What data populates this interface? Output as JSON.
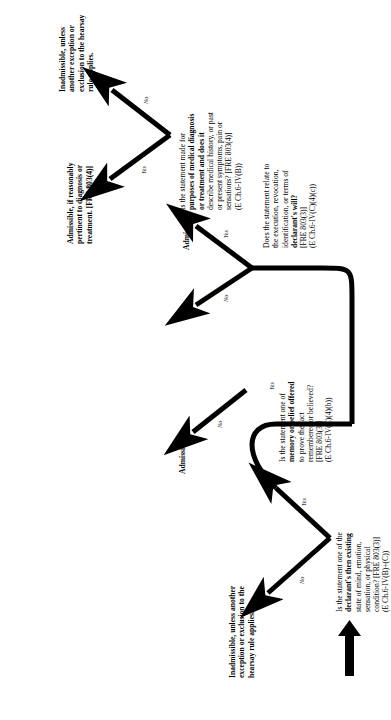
{
  "diagram": {
    "orientation": "rotated-90-ccw",
    "colors": {
      "ink": "#000000",
      "paper": "#ffffff"
    },
    "start": {
      "label": "",
      "icon": "up-arrow-start-marker"
    },
    "nodes": [
      {
        "id": "q-state-of-mind",
        "kind": "question",
        "lines": [
          {
            "t": "Is the statement one of the",
            "bold": false
          },
          {
            "t": "declarant's then existing",
            "bold": true
          },
          {
            "t": "state of mind, emotion,",
            "bold": false
          },
          {
            "t": "sensation, or physical",
            "bold": false
          },
          {
            "t": "condition? [FRE 803(3)]",
            "bold": false
          },
          {
            "t": "(E Ch.6-IV(B)+(C))",
            "bold": false
          }
        ]
      },
      {
        "id": "q-memory-belief",
        "kind": "question",
        "lines": [
          {
            "t": "Is the statement one of",
            "bold": false
          },
          {
            "t": "memory or belief offered",
            "bold": true
          },
          {
            "t": "to prove the fact",
            "bold": false
          },
          {
            "t": "remembered or believed?",
            "bold": false
          },
          {
            "t": "[FRE 803(3)]",
            "bold": false
          },
          {
            "t": "(E Ch.6-IV(C)(4)(b))",
            "bold": false
          }
        ]
      },
      {
        "id": "q-will",
        "kind": "question",
        "lines": [
          {
            "t": "Does the statement relate to",
            "bold": false
          },
          {
            "t": "the execution, revocation,",
            "bold": false
          },
          {
            "t": "identification, or terms of",
            "bold": false
          },
          {
            "t": "declarant's will?",
            "bold": true
          },
          {
            "t": "[FRE 803(3)]",
            "bold": false
          },
          {
            "t": "(E Ch.6-IV(C)(4)(c))",
            "bold": false
          }
        ]
      },
      {
        "id": "q-medical",
        "kind": "question",
        "lines": [
          {
            "t": "Is the statement  made for",
            "bold": false
          },
          {
            "t": "purposes of medical  diagnosis",
            "bold": true
          },
          {
            "t": "or treatment and does it",
            "bold": true
          },
          {
            "t": "describe medical history, or past",
            "bold": false
          },
          {
            "t": "or present symptoms, pain or",
            "bold": false
          },
          {
            "t": "sensations? [FRE 803(4)]",
            "bold": false
          },
          {
            "t": "(E Ch.6-IV(B))",
            "bold": false
          }
        ]
      },
      {
        "id": "t-inadmissible-left",
        "kind": "terminal",
        "lines": [
          {
            "t": "Inadmissible, unless another",
            "bold": true
          },
          {
            "t": "exception or exclusion to the",
            "bold": true
          },
          {
            "t": "hearsay rule applies.",
            "bold": true
          }
        ]
      },
      {
        "id": "t-admissible-mid",
        "kind": "terminal",
        "lines": [
          {
            "t": "Admissible.",
            "bold": true
          }
        ]
      },
      {
        "id": "t-admissible-will",
        "kind": "terminal",
        "lines": [
          {
            "t": "Admissible.",
            "bold": true
          }
        ]
      },
      {
        "id": "t-admissible-medical",
        "kind": "terminal",
        "lines": [
          {
            "t": "Admissible, if reasonably",
            "bold": true
          },
          {
            "t": "pertinent to diagnosis or",
            "bold": true
          },
          {
            "t": "treatment. [FRE 803(4)]",
            "bold": true
          }
        ]
      },
      {
        "id": "t-inadmissible-right",
        "kind": "terminal",
        "lines": [
          {
            "t": "Inadmissible, unless",
            "bold": true
          },
          {
            "t": "another exception or",
            "bold": true
          },
          {
            "t": "exclusion to the hearsay",
            "bold": true
          },
          {
            "t": "rule applies.",
            "bold": true
          }
        ]
      }
    ],
    "edges": [
      {
        "id": "e1",
        "from": "q-state-of-mind",
        "to": "t-inadmissible-left",
        "label": "No"
      },
      {
        "id": "e2",
        "from": "q-state-of-mind",
        "to": "q-memory-belief",
        "label": "Yes"
      },
      {
        "id": "e3",
        "from": "q-memory-belief",
        "to": "t-admissible-mid",
        "label": "No"
      },
      {
        "id": "e4",
        "from": "q-memory-belief",
        "to": "q-will",
        "label": "Yes"
      },
      {
        "id": "e5",
        "from": "q-will",
        "to": "t-admissible-will",
        "label": "Yes"
      },
      {
        "id": "e6",
        "from": "q-will",
        "to": "q-medical",
        "label": "No"
      },
      {
        "id": "e7",
        "from": "q-medical",
        "to": "t-admissible-medical",
        "label": "Yes"
      },
      {
        "id": "e8",
        "from": "q-medical",
        "to": "t-inadmissible-right",
        "label": "No"
      }
    ]
  }
}
